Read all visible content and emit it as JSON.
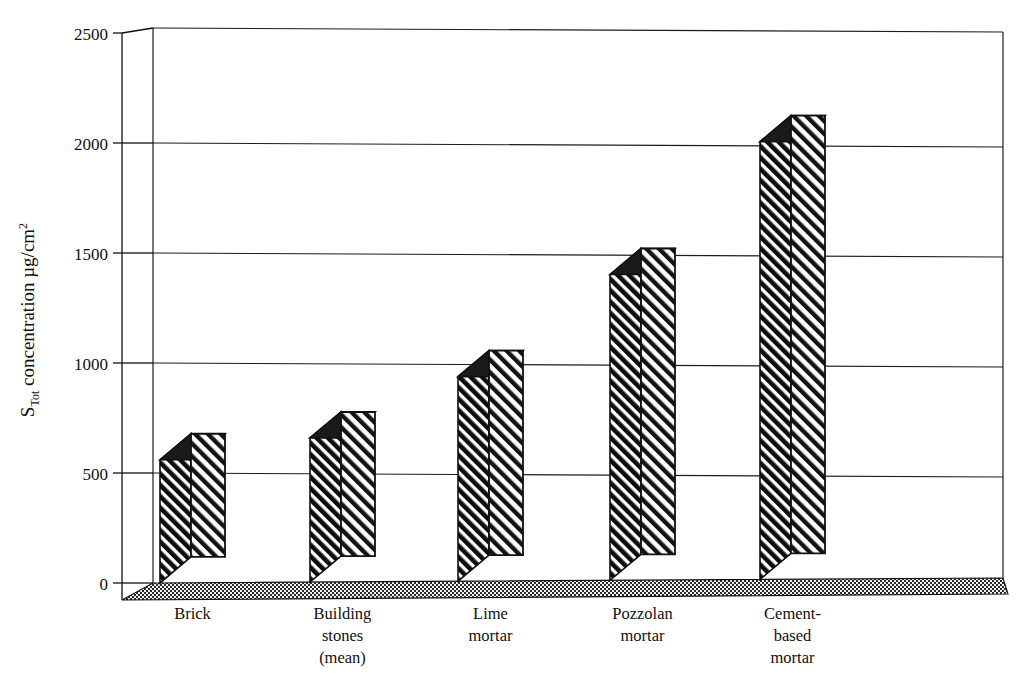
{
  "chart_data": {
    "type": "bar",
    "title": "",
    "subtitle": "",
    "xlabel": "",
    "ylabel_parts": {
      "symbol": "S",
      "subscript": "Tot",
      "text": " concentration µg/cm",
      "superscript": "2"
    },
    "ylabel": "S_Tot concentration µg/cm²",
    "categories": [
      "Brick",
      "Building stones (mean)",
      "Lime mortar",
      "Pozzolan mortar",
      "Cement-based mortar"
    ],
    "category_lines": [
      [
        "Brick"
      ],
      [
        "Building",
        "stones",
        "(mean)"
      ],
      [
        "Lime",
        "mortar"
      ],
      [
        "Pozzolan",
        "mortar"
      ],
      [
        "Cement-",
        "based",
        "mortar"
      ]
    ],
    "values": [
      560,
      655,
      930,
      1390,
      1990
    ],
    "ylim": [
      0,
      2500
    ],
    "yticks": [
      0,
      500,
      1000,
      1500,
      2000,
      2500
    ],
    "ytick_labels": [
      "0",
      "500",
      "1000",
      "1500",
      "2000",
      "2500"
    ],
    "grid": true,
    "grid_axis": "y",
    "legend": null,
    "legend_position": "none",
    "style": "3d-bar",
    "bar_fill": "diagonal-hatch",
    "colors": {
      "bar_line": "#111111",
      "bar_hatch": "#111111",
      "bar_face": "#ffffff",
      "axis": "#111111",
      "grid": "#222222",
      "floor": "#555555",
      "background": "#ffffff"
    }
  }
}
